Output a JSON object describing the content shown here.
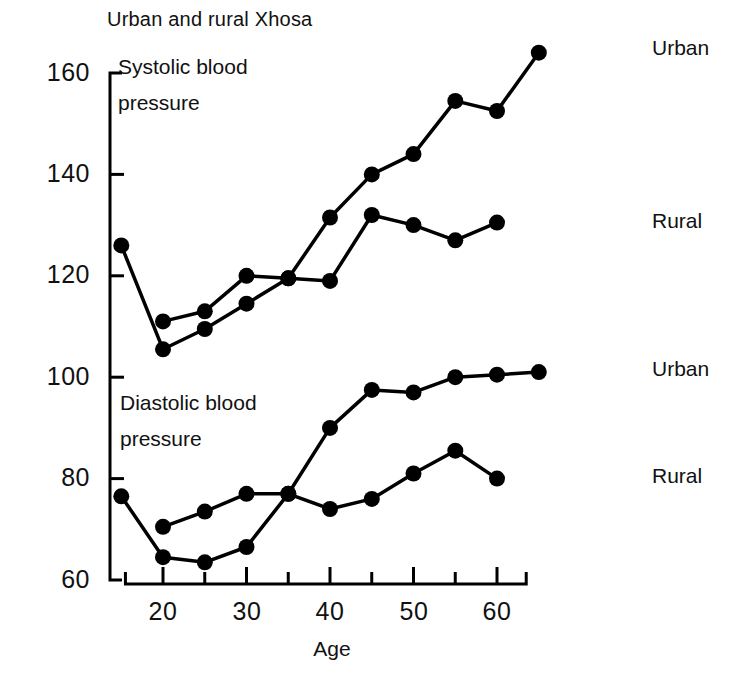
{
  "chart_data": {
    "type": "line",
    "title": "Urban and rural Xhosa",
    "xlabel": "Age",
    "ylabel": "",
    "xlim": [
      12,
      68
    ],
    "ylim": [
      60,
      165
    ],
    "grid": false,
    "legend_position": "right-of-plot (inline series labels)",
    "xticks": [
      20,
      25,
      30,
      35,
      40,
      45,
      50,
      55,
      60
    ],
    "xtick_labels": [
      "20",
      "",
      "30",
      "",
      "40",
      "",
      "50",
      "",
      "60"
    ],
    "yticks": [
      60,
      80,
      100,
      120,
      140,
      160
    ],
    "ytick_labels": [
      "60",
      "80",
      "100",
      "120",
      "140",
      "160"
    ],
    "annotations": [
      {
        "text_line1": "Systolic blood",
        "text_line2": "pressure"
      },
      {
        "text_line1": "Diastolic blood",
        "text_line2": "pressure"
      }
    ],
    "series": [
      {
        "name": "Systolic Urban",
        "label": "Urban",
        "group": "systolic",
        "x": [
          15,
          20,
          25,
          30,
          35,
          40,
          45,
          50,
          55,
          60,
          65
        ],
        "values": [
          126,
          105.5,
          109.5,
          114.5,
          119.5,
          131.5,
          140,
          144,
          154.5,
          152.5,
          164
        ]
      },
      {
        "name": "Systolic Rural",
        "label": "Rural",
        "group": "systolic",
        "x": [
          20,
          25,
          30,
          35,
          40,
          45,
          50,
          55,
          60
        ],
        "values": [
          111,
          113,
          120,
          119.5,
          119,
          132,
          130,
          127,
          130.5
        ]
      },
      {
        "name": "Diastolic Urban",
        "label": "Urban",
        "group": "diastolic",
        "x": [
          15,
          20,
          25,
          30,
          35,
          40,
          45,
          50,
          55,
          60,
          65
        ],
        "values": [
          76.5,
          64.5,
          63.5,
          66.5,
          77,
          90,
          97.5,
          97,
          100,
          100.5,
          101
        ]
      },
      {
        "name": "Diastolic Rural",
        "label": "Rural",
        "group": "diastolic",
        "x": [
          20,
          25,
          30,
          35,
          40,
          45,
          50,
          55,
          60
        ],
        "values": [
          70.5,
          73.5,
          77,
          77,
          74,
          76,
          81,
          85.5,
          80
        ]
      }
    ],
    "series_labels": [
      {
        "text": "Urban",
        "for": "Systolic Urban"
      },
      {
        "text": "Rural",
        "for": "Systolic Rural"
      },
      {
        "text": "Urban",
        "for": "Diastolic Urban"
      },
      {
        "text": "Rural",
        "for": "Diastolic Rural"
      }
    ],
    "style": {
      "line_color": "#000000",
      "marker_color": "#000000",
      "axis_color": "#000000",
      "background": "#ffffff",
      "marker_radius_px": 8,
      "line_width_px": 3.5
    }
  }
}
